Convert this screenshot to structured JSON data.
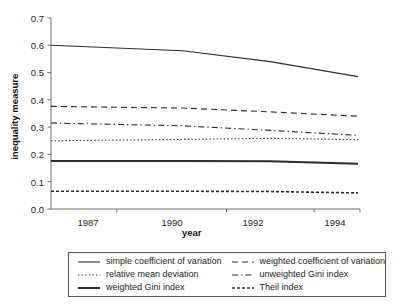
{
  "chart_data": {
    "type": "line",
    "title": "",
    "xlabel": "year",
    "ylabel": "inequality measure",
    "x": [
      1987,
      1990,
      1992,
      1994
    ],
    "xtick_labels": [
      "1987",
      "1990",
      "1992",
      "1994"
    ],
    "ytick_labels": [
      "0.0",
      "0.1",
      "0.2",
      "0.3",
      "0.4",
      "0.5",
      "0.6",
      "0.7"
    ],
    "ylim": [
      0.0,
      0.7
    ],
    "xlim": [
      1987,
      1994
    ],
    "grid": false,
    "legend_position": "below-axes",
    "series": [
      {
        "name": "simple coefficient of variation",
        "style": "solid",
        "width": 1.1,
        "color": "#2b2b2b",
        "values": [
          0.6,
          0.58,
          0.54,
          0.485
        ]
      },
      {
        "name": "weighted coefficient of variation",
        "style": "dashed",
        "width": 1.1,
        "color": "#2b2b2b",
        "values": [
          0.376,
          0.37,
          0.356,
          0.34
        ]
      },
      {
        "name": "relative mean deviation",
        "style": "dotted",
        "width": 1.1,
        "color": "#2b2b2b",
        "values": [
          0.25,
          0.255,
          0.259,
          0.254
        ]
      },
      {
        "name": "unweighted Gini index",
        "style": "dashdot",
        "width": 1.1,
        "color": "#2b2b2b",
        "values": [
          0.315,
          0.305,
          0.288,
          0.27
        ]
      },
      {
        "name": "weighted Gini index",
        "style": "solid-thick",
        "width": 2.0,
        "color": "#2b2b2b",
        "values": [
          0.176,
          0.176,
          0.175,
          0.166
        ]
      },
      {
        "name": "Theil index",
        "style": "shortdash",
        "width": 1.6,
        "color": "#2b2b2b",
        "values": [
          0.065,
          0.065,
          0.064,
          0.059
        ]
      }
    ]
  },
  "axes": {
    "ylabel": "inequality measure",
    "xlabel": "year",
    "yticks": [
      "0.7",
      "0.6",
      "0.5",
      "0.4",
      "0.3",
      "0.2",
      "0.1",
      "0.0"
    ],
    "xticks": [
      "1987",
      "1990",
      "1992",
      "1994"
    ]
  },
  "legend": {
    "entries": [
      {
        "label": "simple coefficient of variation",
        "style": "solid"
      },
      {
        "label": "weighted coefficient of variation",
        "style": "dashed"
      },
      {
        "label": "relative mean deviation",
        "style": "dotted"
      },
      {
        "label": "unweighted Gini index",
        "style": "dashdot"
      },
      {
        "label": "weighted Gini index",
        "style": "solid-thick"
      },
      {
        "label": "Theil index",
        "style": "shortdash"
      }
    ]
  },
  "colors": {
    "line": "#2b2b2b",
    "axis": "#6e6e6e",
    "text": "#1a1a1a",
    "background": "#ffffff"
  }
}
